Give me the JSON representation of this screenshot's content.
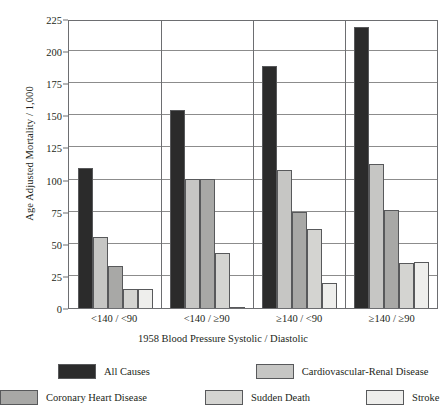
{
  "chart_data": {
    "type": "bar",
    "title": "",
    "xlabel": "1958 Blood Pressure  Systolic / Diastolic",
    "ylabel": "Age Adjusted Mortality / 1,000",
    "ylim": [
      0,
      225
    ],
    "yticks": [
      0,
      25,
      50,
      75,
      100,
      125,
      150,
      175,
      200,
      225
    ],
    "ytick_labels": [
      "0",
      "25",
      "50",
      "75",
      "100",
      "125",
      "150",
      "175",
      "200",
      "225"
    ],
    "grid": true,
    "legend_position": "bottom",
    "categories": [
      "<140 / <90",
      "<140 / ≥90",
      "≥140 / <90",
      "≥140 / ≥90"
    ],
    "series": [
      {
        "name": "All Causes",
        "color": "#2b2b2b",
        "values": [
          110,
          155,
          190,
          220
        ]
      },
      {
        "name": "Cardiovascular-Renal Disease",
        "color": "#c6c6c4",
        "values": [
          56,
          101,
          108,
          113
        ]
      },
      {
        "name": "Coronary Heart Disease",
        "color": "#a8a8a6",
        "values": [
          33,
          101,
          75,
          77
        ]
      },
      {
        "name": "Sudden Death",
        "color": "#d4d4d1",
        "values": [
          15,
          43,
          62,
          35
        ]
      },
      {
        "name": "Stroke",
        "color": "#eeeeec",
        "values": [
          15,
          1,
          20,
          36
        ]
      }
    ]
  },
  "legend": {
    "row1": [
      {
        "label": "All Causes"
      },
      {
        "label": "Cardiovascular-Renal Disease"
      }
    ],
    "row2": [
      {
        "label": "Coronary Heart Disease"
      },
      {
        "label": "Sudden Death"
      },
      {
        "label": "Stroke"
      }
    ]
  }
}
